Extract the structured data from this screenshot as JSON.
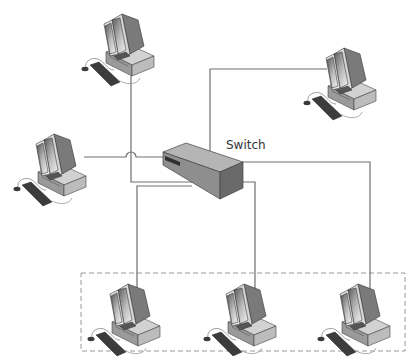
{
  "diagram": {
    "type": "star-network-topology",
    "switch": {
      "label": "Switch",
      "color": "#a9a9a9"
    },
    "link_color": "#6e6e6e",
    "group_box": {
      "style": "dashed",
      "color": "#9a9a9a"
    },
    "nodes": [
      {
        "id": "pc-top-left",
        "kind": "workstation"
      },
      {
        "id": "pc-top-right",
        "kind": "workstation"
      },
      {
        "id": "pc-left",
        "kind": "workstation"
      },
      {
        "id": "pc-bottom-1",
        "kind": "workstation",
        "grouped": true
      },
      {
        "id": "pc-bottom-2",
        "kind": "workstation",
        "grouped": true
      },
      {
        "id": "pc-bottom-3",
        "kind": "workstation",
        "grouped": true
      }
    ]
  }
}
